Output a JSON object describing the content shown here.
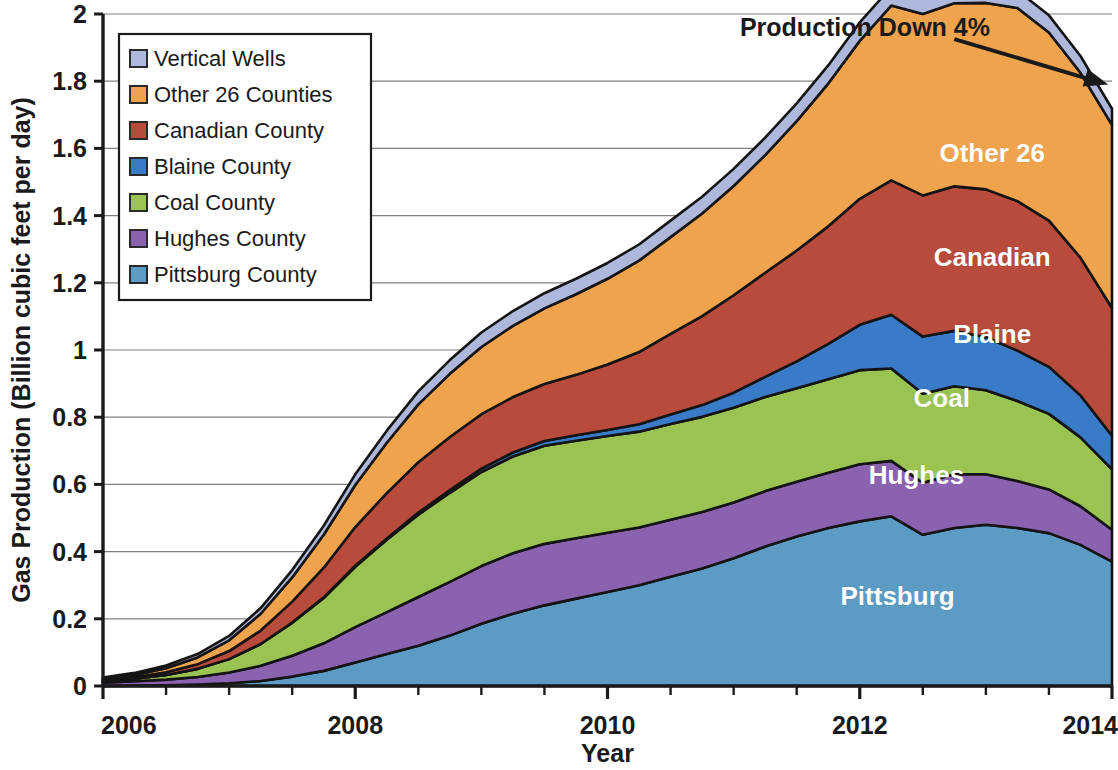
{
  "chart_data": {
    "type": "area",
    "stacked": true,
    "title": "",
    "xlabel": "Year",
    "ylabel": "Gas Production (Billion cubic feet per day)",
    "xlim": [
      2006,
      2014
    ],
    "ylim": [
      0,
      2
    ],
    "ytick_labels": [
      "0",
      "0.2",
      "0.4",
      "0.6",
      "0.8",
      "1",
      "1.2",
      "1.4",
      "1.6",
      "1.8",
      "2"
    ],
    "ytick_values": [
      0,
      0.2,
      0.4,
      0.6,
      0.8,
      1.0,
      1.2,
      1.4,
      1.6,
      1.8,
      2.0
    ],
    "xtick_labels": [
      "2006",
      "2008",
      "2010",
      "2012",
      "2014"
    ],
    "xtick_values": [
      2006,
      2008,
      2010,
      2012,
      2014
    ],
    "xminor_step": 0.5,
    "grid": "horizontal",
    "legend_position": "top-left",
    "x": [
      2006.0,
      2006.25,
      2006.5,
      2006.75,
      2007.0,
      2007.25,
      2007.5,
      2007.75,
      2008.0,
      2008.25,
      2008.5,
      2008.75,
      2009.0,
      2009.25,
      2009.5,
      2009.75,
      2010.0,
      2010.25,
      2010.5,
      2010.75,
      2011.0,
      2011.25,
      2011.5,
      2011.75,
      2012.0,
      2012.25,
      2012.5,
      2012.75,
      2013.0,
      2013.25,
      2013.5,
      2013.75,
      2014.0
    ],
    "series": [
      {
        "name": "Pittsburg County",
        "short_label": "Pittsburg",
        "color": "#5B9BC4",
        "values": [
          0.0,
          0.001,
          0.002,
          0.004,
          0.008,
          0.015,
          0.028,
          0.045,
          0.07,
          0.095,
          0.12,
          0.15,
          0.185,
          0.215,
          0.24,
          0.26,
          0.28,
          0.3,
          0.325,
          0.35,
          0.38,
          0.415,
          0.445,
          0.47,
          0.49,
          0.505,
          0.45,
          0.47,
          0.48,
          0.47,
          0.455,
          0.42,
          0.37
        ]
      },
      {
        "name": "Hughes County",
        "short_label": "Hughes",
        "color": "#8B62B0",
        "values": [
          0.01,
          0.013,
          0.017,
          0.023,
          0.032,
          0.045,
          0.062,
          0.082,
          0.105,
          0.125,
          0.145,
          0.16,
          0.172,
          0.18,
          0.183,
          0.18,
          0.176,
          0.172,
          0.17,
          0.168,
          0.166,
          0.165,
          0.163,
          0.165,
          0.17,
          0.165,
          0.155,
          0.16,
          0.15,
          0.14,
          0.13,
          0.115,
          0.095
        ]
      },
      {
        "name": "Coal County",
        "short_label": "Coal",
        "color": "#9BC351",
        "values": [
          0.004,
          0.008,
          0.014,
          0.024,
          0.04,
          0.065,
          0.098,
          0.135,
          0.18,
          0.215,
          0.245,
          0.265,
          0.28,
          0.288,
          0.292,
          0.29,
          0.288,
          0.285,
          0.285,
          0.283,
          0.282,
          0.28,
          0.278,
          0.278,
          0.28,
          0.275,
          0.265,
          0.262,
          0.25,
          0.238,
          0.225,
          0.205,
          0.18
        ]
      },
      {
        "name": "Blaine County",
        "short_label": "Blaine",
        "color": "#3A7BC8",
        "values": [
          0.0,
          0.0,
          0.0,
          0.0,
          0.0,
          0.0,
          0.001,
          0.002,
          0.003,
          0.004,
          0.006,
          0.008,
          0.01,
          0.012,
          0.014,
          0.016,
          0.018,
          0.022,
          0.028,
          0.035,
          0.045,
          0.06,
          0.08,
          0.105,
          0.135,
          0.16,
          0.17,
          0.165,
          0.158,
          0.15,
          0.14,
          0.125,
          0.1
        ]
      },
      {
        "name": "Canadian County",
        "short_label": "Canadian",
        "color": "#B84B3C",
        "values": [
          0.002,
          0.004,
          0.008,
          0.014,
          0.024,
          0.04,
          0.062,
          0.088,
          0.115,
          0.135,
          0.15,
          0.158,
          0.162,
          0.165,
          0.17,
          0.18,
          0.195,
          0.215,
          0.24,
          0.265,
          0.29,
          0.31,
          0.33,
          0.35,
          0.375,
          0.4,
          0.42,
          0.43,
          0.44,
          0.445,
          0.435,
          0.41,
          0.38
        ]
      },
      {
        "name": "Other 26 Counties",
        "short_label": "Other 26",
        "color": "#EFA34C",
        "values": [
          0.004,
          0.007,
          0.012,
          0.02,
          0.032,
          0.05,
          0.072,
          0.098,
          0.125,
          0.15,
          0.172,
          0.188,
          0.2,
          0.212,
          0.225,
          0.24,
          0.255,
          0.272,
          0.288,
          0.305,
          0.325,
          0.35,
          0.385,
          0.425,
          0.47,
          0.52,
          0.54,
          0.545,
          0.555,
          0.575,
          0.56,
          0.55,
          0.545
        ]
      },
      {
        "name": "Vertical Wells",
        "short_label": "",
        "color": "#AEB8DC",
        "values": [
          0.005,
          0.006,
          0.008,
          0.01,
          0.013,
          0.017,
          0.022,
          0.027,
          0.032,
          0.036,
          0.039,
          0.041,
          0.043,
          0.044,
          0.045,
          0.046,
          0.047,
          0.048,
          0.049,
          0.05,
          0.051,
          0.052,
          0.053,
          0.054,
          0.055,
          0.055,
          0.055,
          0.054,
          0.053,
          0.052,
          0.051,
          0.05,
          0.048
        ]
      }
    ],
    "annotations": [
      {
        "name": "production-down-annotation",
        "text": "Production  Down 4%",
        "x_text": 2011.05,
        "y_text": 1.935,
        "arrow_from": {
          "x": 2012.75,
          "y": 1.925
        },
        "arrow_to": {
          "x": 2013.97,
          "y": 1.79
        }
      }
    ],
    "inchart_labels": [
      {
        "text": "Other 26",
        "x": 2013.05,
        "y": 1.56
      },
      {
        "text": "Canadian",
        "x": 2013.05,
        "y": 1.25
      },
      {
        "text": "Blaine",
        "x": 2013.05,
        "y": 1.02
      },
      {
        "text": "Coal",
        "x": 2012.65,
        "y": 0.83
      },
      {
        "text": "Hughes",
        "x": 2012.45,
        "y": 0.6
      },
      {
        "text": "Pittsburg",
        "x": 2012.3,
        "y": 0.24
      }
    ]
  },
  "legend": {
    "items": [
      {
        "label": "Vertical Wells",
        "color": "#AEB8DC"
      },
      {
        "label": "Other 26 Counties",
        "color": "#EFA34C"
      },
      {
        "label": "Canadian County",
        "color": "#B84B3C"
      },
      {
        "label": "Blaine County",
        "color": "#3A7BC8"
      },
      {
        "label": "Coal County",
        "color": "#9BC351"
      },
      {
        "label": "Hughes County",
        "color": "#8B62B0"
      },
      {
        "label": "Pittsburg County",
        "color": "#5B9BC4"
      }
    ]
  },
  "colors": {
    "axis": "#1a1a1a",
    "grid": "#808080",
    "outline": "#141414",
    "background": "#ffffff",
    "legend_border": "#1a1a1a",
    "label_text": "#ffffff"
  }
}
